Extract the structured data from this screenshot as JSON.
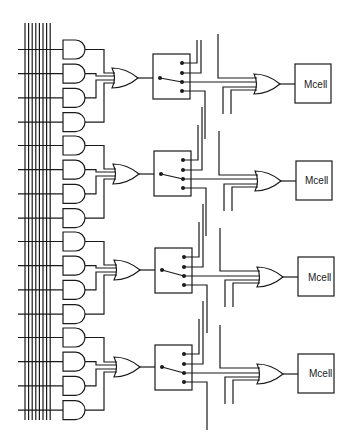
{
  "diagram": {
    "type": "product-term allocator circuit",
    "colors": {
      "line": "#1a1a1a",
      "background": "#ffffff"
    },
    "input_bus": {
      "vertical_lines": 8,
      "horizontal_inputs": 16
    },
    "blocks": [
      {
        "id": 1,
        "and_gates": 4,
        "or_gate": "or-1",
        "switch": "steering-switch-1",
        "mcell": {
          "label": "Mcell"
        }
      },
      {
        "id": 2,
        "and_gates": 4,
        "or_gate": "or-2",
        "switch": "steering-switch-2",
        "mcell": {
          "label": "Mcell"
        }
      },
      {
        "id": 3,
        "and_gates": 4,
        "or_gate": "or-3",
        "switch": "steering-switch-3",
        "mcell": {
          "label": "Mcell"
        }
      },
      {
        "id": 4,
        "and_gates": 4,
        "or_gate": "or-4",
        "switch": "steering-switch-4",
        "mcell": {
          "label": "Mcell"
        }
      }
    ]
  }
}
